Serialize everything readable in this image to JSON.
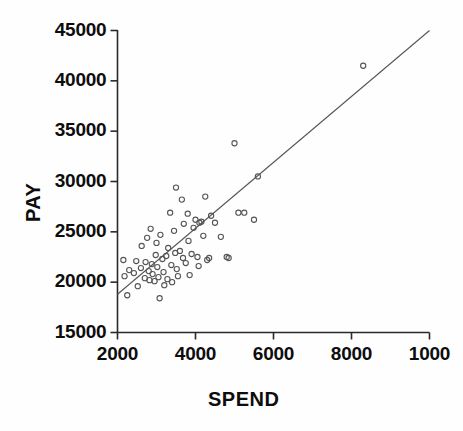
{
  "chart_data": {
    "type": "scatter",
    "title": "",
    "xlabel": "SPEND",
    "ylabel": "PAY",
    "xlim": [
      2000,
      10000
    ],
    "ylim": [
      15000,
      45000
    ],
    "xticks": [
      2000,
      4000,
      6000,
      8000,
      10000
    ],
    "xtick_labels": [
      "2000",
      "4000",
      "6000",
      "8000",
      "1000"
    ],
    "yticks": [
      15000,
      20000,
      25000,
      30000,
      35000,
      40000,
      45000
    ],
    "ytick_labels": [
      "15000",
      "20000",
      "25000",
      "30000",
      "35000",
      "40000",
      "45000"
    ],
    "grid": false,
    "legend": false,
    "marker": "open-circle",
    "marker_color": "#555555",
    "line_color": "#555555",
    "points": [
      [
        2150,
        22200
      ],
      [
        2180,
        20600
      ],
      [
        2250,
        18700
      ],
      [
        2300,
        21200
      ],
      [
        2420,
        20900
      ],
      [
        2480,
        22100
      ],
      [
        2520,
        19600
      ],
      [
        2600,
        21400
      ],
      [
        2620,
        23600
      ],
      [
        2700,
        20400
      ],
      [
        2720,
        22000
      ],
      [
        2760,
        24400
      ],
      [
        2800,
        21100
      ],
      [
        2820,
        20200
      ],
      [
        2850,
        25300
      ],
      [
        2880,
        21800
      ],
      [
        2900,
        20800
      ],
      [
        2950,
        20100
      ],
      [
        2980,
        22700
      ],
      [
        3000,
        23900
      ],
      [
        3020,
        21500
      ],
      [
        3050,
        20500
      ],
      [
        3080,
        18400
      ],
      [
        3100,
        24700
      ],
      [
        3150,
        22300
      ],
      [
        3180,
        21000
      ],
      [
        3200,
        19700
      ],
      [
        3250,
        22600
      ],
      [
        3280,
        20300
      ],
      [
        3300,
        23400
      ],
      [
        3350,
        26900
      ],
      [
        3380,
        21700
      ],
      [
        3400,
        20000
      ],
      [
        3450,
        25100
      ],
      [
        3480,
        22900
      ],
      [
        3500,
        29400
      ],
      [
        3520,
        21300
      ],
      [
        3550,
        20600
      ],
      [
        3600,
        23100
      ],
      [
        3650,
        28200
      ],
      [
        3680,
        22400
      ],
      [
        3700,
        25800
      ],
      [
        3750,
        21900
      ],
      [
        3800,
        26800
      ],
      [
        3820,
        24100
      ],
      [
        3850,
        20700
      ],
      [
        3900,
        22800
      ],
      [
        3950,
        25400
      ],
      [
        4000,
        26200
      ],
      [
        4050,
        22500
      ],
      [
        4080,
        21600
      ],
      [
        4100,
        25900
      ],
      [
        4150,
        26000
      ],
      [
        4200,
        24600
      ],
      [
        4250,
        28500
      ],
      [
        4300,
        22200
      ],
      [
        4350,
        22400
      ],
      [
        4400,
        26600
      ],
      [
        4500,
        25900
      ],
      [
        4650,
        24500
      ],
      [
        4800,
        22500
      ],
      [
        4850,
        22400
      ],
      [
        5000,
        33800
      ],
      [
        5100,
        26900
      ],
      [
        5250,
        26900
      ],
      [
        5500,
        26200
      ],
      [
        5600,
        30500
      ],
      [
        8300,
        41500
      ]
    ],
    "regression_line": {
      "x": [
        2000,
        10000
      ],
      "y": [
        18800,
        45000
      ]
    }
  }
}
